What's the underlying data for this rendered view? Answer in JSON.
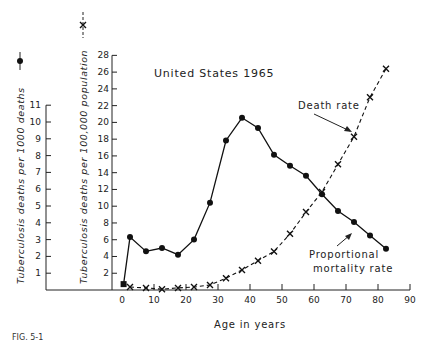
{
  "chart_data": {
    "type": "line",
    "title": "United States 1965",
    "xlabel": "Age in years",
    "x_ticks": [
      0,
      10,
      20,
      30,
      40,
      50,
      60,
      70,
      80,
      90
    ],
    "xlim": [
      0,
      90
    ],
    "y_axes": [
      {
        "id": "left",
        "label": "Tuberculosis deaths per 1000 deaths",
        "marker": "dot",
        "ticks": [
          1,
          2,
          3,
          4,
          5,
          6,
          7,
          8,
          9,
          10,
          11
        ],
        "ylim": [
          0,
          11
        ]
      },
      {
        "id": "right",
        "label": "Tuberculosis deaths per 100,000 population",
        "marker": "cross",
        "ticks": [
          2,
          4,
          6,
          8,
          10,
          12,
          14,
          16,
          18,
          20,
          22,
          24,
          26,
          28
        ],
        "ylim": [
          0,
          28
        ]
      }
    ],
    "series": [
      {
        "name": "Proportional mortality rate",
        "axis": "left",
        "style": "solid line, filled circles",
        "x": [
          0.5,
          2.5,
          7.5,
          12.5,
          17.5,
          22.5,
          27.5,
          32.5,
          37.5,
          42.5,
          47.5,
          52.5,
          57.5,
          62.5,
          67.5,
          72.5,
          77.5,
          82.5
        ],
        "values": [
          0.35,
          3.15,
          2.3,
          2.5,
          2.1,
          3.0,
          5.2,
          8.9,
          10.25,
          9.65,
          8.05,
          7.4,
          6.8,
          5.7,
          4.7,
          4.05,
          3.25,
          2.45
        ]
      },
      {
        "name": "Death rate",
        "axis": "right",
        "style": "dashed line, x markers",
        "x": [
          2.5,
          7.5,
          12.5,
          17.5,
          22.5,
          27.5,
          32.5,
          37.5,
          42.5,
          47.5,
          52.5,
          57.5,
          62.5,
          67.5,
          72.5,
          77.5,
          82.5
        ],
        "values": [
          0.35,
          0.25,
          0.1,
          0.25,
          0.35,
          0.6,
          1.4,
          2.4,
          3.5,
          4.6,
          6.7,
          9.3,
          11.7,
          15.0,
          18.3,
          23.0,
          26.4
        ]
      }
    ],
    "annotations": [
      {
        "text": "Death rate",
        "points_to": "Death rate series near age 72"
      },
      {
        "text": "Proportional mortality rate",
        "points_to": "Proportional mortality series near age 72"
      }
    ],
    "grid": false,
    "legend": "axis-label markers (dot on left label, cross on right label)"
  },
  "labels": {
    "title": "United States 1965",
    "xlabel": "Age in years",
    "left_ylabel": "Tuberculosis deaths per 1000 deaths",
    "right_ylabel": "Tuberculosis deaths per 100,000 population",
    "death_rate": "Death rate",
    "prop_line1": "Proportional",
    "prop_line2": "mortality rate",
    "caption": "FIG. 5-1"
  }
}
